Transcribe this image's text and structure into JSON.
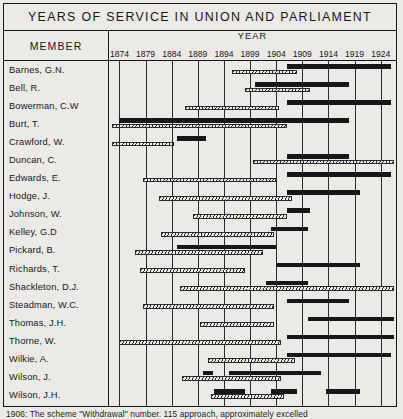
{
  "title": "YEARS OF SERVICE IN UNION AND PARLIAMENT",
  "columns": {
    "member_header": "MEMBER",
    "year_header": "YEAR"
  },
  "caption": "1906: The scheme \"Withdrawal\" number. 115 approach, approximately excelled",
  "legend": {
    "union_series": "Union service (hatched)",
    "parliament_series": "Parliament service (solid)"
  },
  "colors": {
    "ink": "#17171a",
    "paper": "#eceae6",
    "hatch_fill": "#f2f0ec"
  },
  "chart_data": {
    "type": "bar",
    "title": "YEARS OF SERVICE IN UNION AND PARLIAMENT",
    "xlabel": "YEAR",
    "ylabel": "MEMBER",
    "xlim": [
      1872,
      1927
    ],
    "grid": true,
    "legend_position": "none",
    "tick_labels": [
      1874,
      1879,
      1884,
      1889,
      1894,
      1899,
      1904,
      1909,
      1914,
      1919,
      1924
    ],
    "categories": [
      "Barnes, G.N.",
      "Bell, R.",
      "Bowerman, C.W",
      "Burt, T.",
      "Crawford, W.",
      "Duncan, C.",
      "Edwards, E.",
      "Hodge, J.",
      "Johnson, W.",
      "Kelley, G.D",
      "Pickard, B.",
      "Richards, T.",
      "Shackleton, D.J.",
      "Steadman, W.C.",
      "Thomas, J.H.",
      "Thorne, W.",
      "Wilkie, A.",
      "Wilson, J.",
      "Wilson, J.H."
    ],
    "series": [
      {
        "name": "Union service (hatched)",
        "style": "hatched",
        "spans": [
          [
            [
              1895.5,
              1908.0
            ]
          ],
          [
            [
              1898.0,
              1910.5
            ]
          ],
          [
            [
              1886.5,
              1904.5
            ]
          ],
          [
            [
              1872.5,
              1906.0
            ]
          ],
          [
            [
              1872.5,
              1884.5
            ]
          ],
          [
            [
              1899.5,
              1926.5
            ]
          ],
          [
            [
              1878.5,
              1904.0
            ]
          ],
          [
            [
              1881.5,
              1907.0
            ]
          ],
          [
            [
              1888.0,
              1906.0
            ]
          ],
          [
            [
              1882.0,
              1903.5
            ]
          ],
          [
            [
              1877.0,
              1901.5
            ]
          ],
          [
            [
              1878.0,
              1898.0
            ]
          ],
          [
            [
              1885.5,
              1926.5
            ]
          ],
          [
            [
              1878.5,
              1903.5
            ]
          ],
          [
            [
              1889.5,
              1903.5
            ]
          ],
          [
            [
              1874.0,
              1905.0
            ]
          ],
          [
            [
              1891.0,
              1907.5
            ]
          ],
          [
            [
              1886.0,
              1905.0
            ]
          ],
          [
            [
              1891.5,
              1905.5
            ]
          ]
        ]
      },
      {
        "name": "Parliament service (solid)",
        "style": "solid",
        "spans": [
          [
            [
              1906.0,
              1926.0
            ]
          ],
          [
            [
              1900.0,
              1918.0
            ]
          ],
          [
            [
              1906.0,
              1926.0
            ]
          ],
          [
            [
              1874.0,
              1918.0
            ]
          ],
          [
            [
              1885.0,
              1890.5
            ]
          ],
          [
            [
              1906.0,
              1918.0
            ]
          ],
          [
            [
              1906.0,
              1926.0
            ]
          ],
          [
            [
              1906.0,
              1920.0
            ]
          ],
          [
            [
              1906.0,
              1910.5
            ]
          ],
          [
            [
              1903.0,
              1910.0
            ]
          ],
          [
            [
              1885.0,
              1904.0
            ]
          ],
          [
            [
              1904.0,
              1920.0
            ]
          ],
          [
            [
              1902.0,
              1910.0
            ]
          ],
          [
            [
              1906.0,
              1918.0
            ]
          ],
          [
            [
              1910.0,
              1926.5
            ]
          ],
          [
            [
              1906.0,
              1926.5
            ]
          ],
          [
            [
              1906.0,
              1926.0
            ]
          ],
          [
            [
              1890.0,
              1892.0
            ],
            [
              1895.0,
              1912.5
            ]
          ],
          [
            [
              1892.0,
              1898.0
            ],
            [
              1903.0,
              1908.0
            ],
            [
              1913.5,
              1920.0
            ]
          ]
        ]
      }
    ]
  }
}
